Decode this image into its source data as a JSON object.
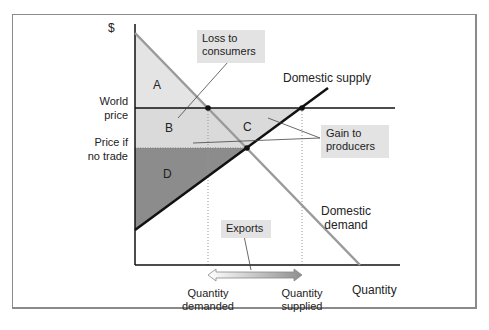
{
  "axes": {
    "y_label": "$",
    "x_label": "Quantity"
  },
  "price_labels": {
    "world_price_1": "World",
    "world_price_2": "price",
    "no_trade_1": "Price if",
    "no_trade_2": "no trade"
  },
  "curves": {
    "supply": "Domestic supply",
    "demand_1": "Domestic",
    "demand_2": "demand"
  },
  "regions": {
    "a": "A",
    "b": "B",
    "c": "C",
    "d": "D"
  },
  "callouts": {
    "loss_1": "Loss to",
    "loss_2": "consumers",
    "gain_1": "Gain to",
    "gain_2": "producers",
    "exports": "Exports"
  },
  "quantities": {
    "demanded_1": "Quantity",
    "demanded_2": "demanded",
    "supplied_1": "Quantity",
    "supplied_2": "supplied"
  },
  "colors": {
    "light_fill": "#dcdcdc",
    "dark_fill": "#8c8c8c",
    "demand_line": "#9a9a9a",
    "supply_line": "#111111"
  }
}
